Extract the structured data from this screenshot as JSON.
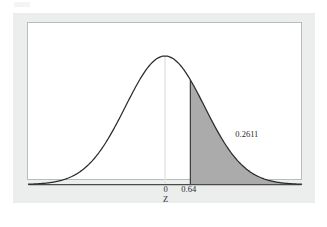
{
  "figure": {
    "background_color": "#eceded",
    "panel_color": "#ffffff",
    "panel_border_color": "#b9bcbe",
    "curve_color": "#2b2b2b",
    "shade_color": "#ababab",
    "center_line_color": "#e3e3e3"
  },
  "labels": {
    "tick_zero": "0",
    "tick_cutoff": "0.64",
    "axis_title": "Z",
    "area_value": "0.2611"
  },
  "chart_data": {
    "type": "area",
    "title": "",
    "subtitle": "",
    "xlabel": "Z",
    "ylabel": "",
    "grid": false,
    "legend": null,
    "distribution": "standard normal",
    "mean": 0,
    "sd": 1,
    "xlim": [
      -3.45,
      3.45
    ],
    "ylim": [
      0,
      0.4
    ],
    "tick_labels": [
      "0",
      "0.64"
    ],
    "tick_values": [
      0,
      0.64
    ],
    "annotations": [
      {
        "text": "0.2611",
        "describes": "shaded right-tail area",
        "x": 1.6,
        "y": 0.09
      }
    ],
    "vertical_lines": [
      {
        "x": 0,
        "label": "0",
        "color": "#e3e3e3",
        "from_axis_to_curve": true
      },
      {
        "x": 0.64,
        "label": "0.64",
        "color": "#2b2b2b",
        "from_axis_to_curve": true
      }
    ],
    "shaded_regions": [
      {
        "from": 0.64,
        "to": 3.45,
        "area": 0.2611,
        "color": "#ababab",
        "label": "0.2611"
      }
    ],
    "x": [
      -3.45,
      -3.2,
      -3.0,
      -2.8,
      -2.6,
      -2.4,
      -2.2,
      -2.0,
      -1.8,
      -1.6,
      -1.4,
      -1.2,
      -1.0,
      -0.8,
      -0.6,
      -0.4,
      -0.2,
      0.0,
      0.2,
      0.4,
      0.6,
      0.64,
      0.8,
      1.0,
      1.2,
      1.4,
      1.6,
      1.8,
      2.0,
      2.2,
      2.4,
      2.6,
      2.8,
      3.0,
      3.2,
      3.45
    ],
    "y": [
      0.0011,
      0.0024,
      0.0044,
      0.0079,
      0.0136,
      0.0224,
      0.0355,
      0.054,
      0.079,
      0.1109,
      0.1497,
      0.1942,
      0.242,
      0.2897,
      0.3332,
      0.3683,
      0.391,
      0.3989,
      0.391,
      0.3683,
      0.3332,
      0.3251,
      0.2897,
      0.242,
      0.1942,
      0.1497,
      0.1109,
      0.079,
      0.054,
      0.0355,
      0.0224,
      0.0136,
      0.0079,
      0.0044,
      0.0024,
      0.0011
    ]
  }
}
